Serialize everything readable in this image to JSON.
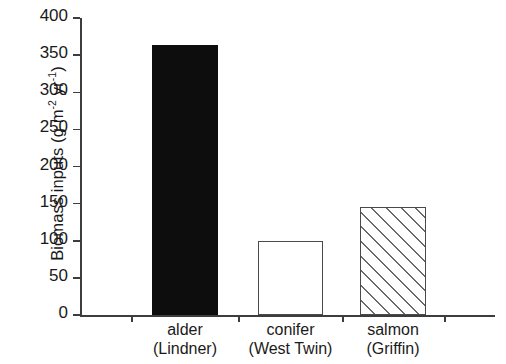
{
  "chart_data": {
    "type": "bar",
    "title": "",
    "xlabel": "",
    "ylabel": "Biomass inputs (g m-2 yr-1)",
    "ylabel_parts": {
      "prefix": "Biomass inputs (g m",
      "sup1": "-2",
      "mid": " yr",
      "sup2": "-1",
      "suffix": ")"
    },
    "categories": [
      "alder (Lindner)",
      "conifer (West Twin)",
      "salmon (Griffin)"
    ],
    "category_lines": [
      {
        "line1": "alder",
        "line2": "(Lindner)"
      },
      {
        "line1": "conifer",
        "line2": "(West Twin)"
      },
      {
        "line1": "salmon",
        "line2": "(Griffin)"
      }
    ],
    "values": [
      363,
      100,
      146
    ],
    "bar_styles": [
      "solid-black",
      "open-white",
      "diagonal-hatch"
    ],
    "ylim": [
      0,
      400
    ],
    "ytick_values": [
      0,
      50,
      100,
      150,
      200,
      250,
      300,
      350,
      400
    ],
    "ytick_labels": [
      "0",
      "50",
      "100",
      "150",
      "200",
      "250",
      "300",
      "350",
      "400"
    ],
    "grid": false,
    "legend": "none",
    "colors": {
      "axis": "#3d3d3d",
      "text": "#1a1a1a",
      "bar_solid": "#0d0d0d",
      "bar_open_fill": "#ffffff",
      "bar_outline": "#4a4a4a",
      "hatch_line": "#6a6a6a",
      "background": "#ffffff"
    }
  }
}
